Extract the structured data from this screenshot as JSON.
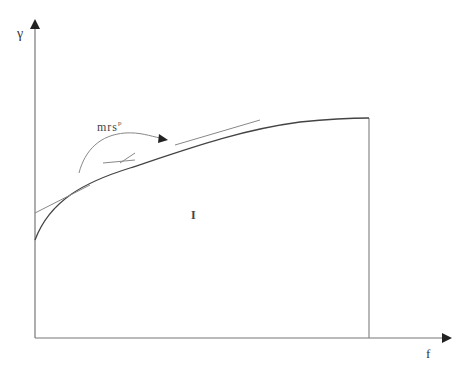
{
  "diagram": {
    "axes": {
      "y_label": "γ",
      "x_label": "f"
    },
    "region_label": "I",
    "annotation": {
      "text": "mrs",
      "superscript": "p"
    },
    "elements": [
      "y-axis with arrowhead",
      "x-axis with arrowhead",
      "concave increasing curve from y-axis to vertical boundary",
      "vertical boundary line at right end of curve",
      "tangent line at lower part of curve",
      "tangent line at upper-middle part of curve",
      "small crossing tangent near annotation",
      "curved arrow from label to curve"
    ],
    "colors": {
      "stroke": "#555555",
      "text": "#333333",
      "background": "#ffffff"
    }
  }
}
